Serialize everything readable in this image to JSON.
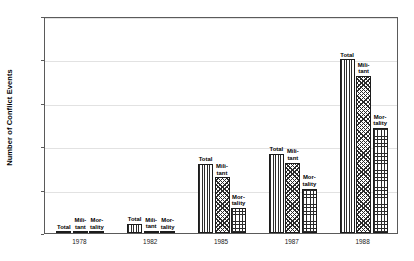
{
  "chart_data": {
    "type": "bar",
    "title": "",
    "xlabel": "",
    "ylabel": "Number of Conflict Events",
    "ylim": [
      0,
      2500
    ],
    "ytick_values": [
      0,
      500,
      1000,
      1500,
      2000,
      2500
    ],
    "ytick_labels": [
      "0",
      "500",
      "1000",
      "1500",
      "2000",
      "2500"
    ],
    "grid": true,
    "legend": "none",
    "categories": [
      "1978",
      "1982",
      "1985",
      "1987",
      "1988"
    ],
    "series": [
      {
        "name": "Total",
        "label": "Total",
        "pattern": "vertical-stripes",
        "values": [
          18,
          100,
          800,
          910,
          2000
        ]
      },
      {
        "name": "Militant",
        "label": "Mili-\ntant",
        "pattern": "diagonal-crosshatch",
        "values": [
          12,
          25,
          640,
          810,
          1810
        ]
      },
      {
        "name": "Mortality",
        "label": "Mor-\ntality",
        "pattern": "square-grid",
        "values": [
          5,
          5,
          290,
          510,
          1210
        ]
      }
    ],
    "colors": {
      "ink": "#2b2b2b",
      "bar_outline": "#1c1c1c",
      "gridline": "#e2e2e2",
      "frame": "#5a5a5a",
      "background": "#ffffff"
    }
  }
}
